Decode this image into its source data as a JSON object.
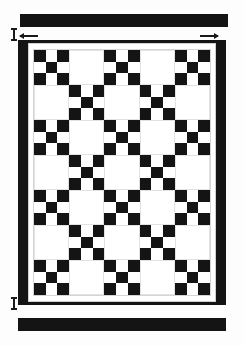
{
  "diagram": {
    "type": "quilt-pattern-schematic"
  },
  "colors": {
    "dark_fabric": "#141414",
    "light_fabric": "#ffffff",
    "sashing": "#ffffff",
    "outline": "#cfcfcf",
    "background": "#fdfdfd",
    "marker": "#1a1a1a"
  },
  "binding_strips": [
    {
      "name": "top-binding-strip",
      "label": "",
      "position": "top"
    },
    {
      "name": "bottom-binding-strip",
      "label": "",
      "position": "bottom"
    }
  ],
  "markers": {
    "top_tick_label": "",
    "bottom_tick_label": "",
    "left_arrow_label": "",
    "right_arrow_label": ""
  },
  "quilt": {
    "border": {
      "left_width_label": "",
      "right_width_label": "",
      "top_width_label": "",
      "bottom_width_label": ""
    },
    "field": {
      "columns": 5,
      "rows": 7,
      "block_types": [
        "ninepatch",
        "plain"
      ],
      "layout": [
        [
          "ninepatch",
          "plain",
          "ninepatch",
          "plain",
          "ninepatch"
        ],
        [
          "plain",
          "ninepatch",
          "plain",
          "ninepatch",
          "plain"
        ],
        [
          "ninepatch",
          "plain",
          "ninepatch",
          "plain",
          "ninepatch"
        ],
        [
          "plain",
          "ninepatch",
          "plain",
          "ninepatch",
          "plain"
        ],
        [
          "ninepatch",
          "plain",
          "ninepatch",
          "plain",
          "ninepatch"
        ],
        [
          "plain",
          "ninepatch",
          "plain",
          "ninepatch",
          "plain"
        ],
        [
          "ninepatch",
          "plain",
          "ninepatch",
          "plain",
          "ninepatch"
        ]
      ],
      "ninepatch_pattern": [
        [
          "dark",
          "light",
          "dark"
        ],
        [
          "light",
          "dark",
          "light"
        ],
        [
          "dark",
          "light",
          "dark"
        ]
      ]
    }
  }
}
